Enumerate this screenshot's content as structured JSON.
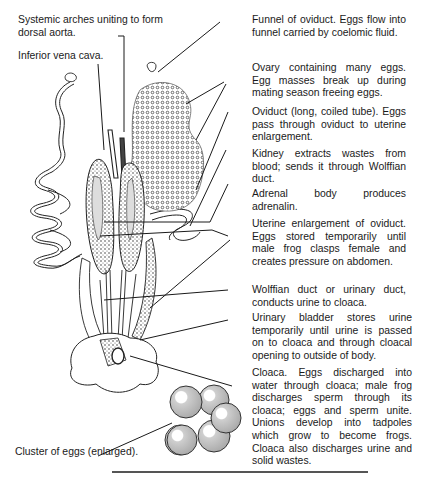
{
  "diagram": {
    "left_labels": [
      {
        "id": "systemic-arches",
        "text": "Systemic arches uniting to form dorsal aorta."
      },
      {
        "id": "inferior-vena-cava",
        "text": "Inferior vena cava."
      },
      {
        "id": "cluster-of-eggs",
        "text": "Cluster of eggs (enlarged)."
      }
    ],
    "right_labels": [
      {
        "id": "funnel-of-oviduct",
        "text": "Funnel of oviduct. Eggs flow into funnel carried by coelomic fluid."
      },
      {
        "id": "ovary",
        "text": "Ovary containing many eggs. Egg masses break up during mating season freeing eggs."
      },
      {
        "id": "oviduct",
        "text": "Oviduct (long, coiled tube). Eggs pass through oviduct to uterine enlargement."
      },
      {
        "id": "kidney",
        "text": "Kidney extracts wastes from blood; sends it through Wolffian duct."
      },
      {
        "id": "adrenal-body",
        "text": "Adrenal body produces adrenalin."
      },
      {
        "id": "uterine-enlargement",
        "text": "Uterine enlargement of oviduct. Eggs stored temporarily until male frog clasps female and creates pressure on abdomen."
      },
      {
        "id": "wolffian-duct",
        "text": "Wolffian duct or urinary duct, conducts urine to cloaca."
      },
      {
        "id": "urinary-bladder",
        "text": "Urinary bladder stores urine temporarily until urine is passed on to cloaca and through cloacal opening to outside of body."
      },
      {
        "id": "cloaca",
        "text": "Cloaca. Eggs discharged into water through cloaca; male frog discharges sperm through its cloaca; eggs and sperm unite. Unions develop into tadpoles which grow to become frogs. Cloaca also discharges urine and solid wastes."
      }
    ],
    "colors": {
      "ink": "#1a1a1a",
      "egg_fill": "#c9c9c9",
      "stipple": "#555555"
    }
  }
}
